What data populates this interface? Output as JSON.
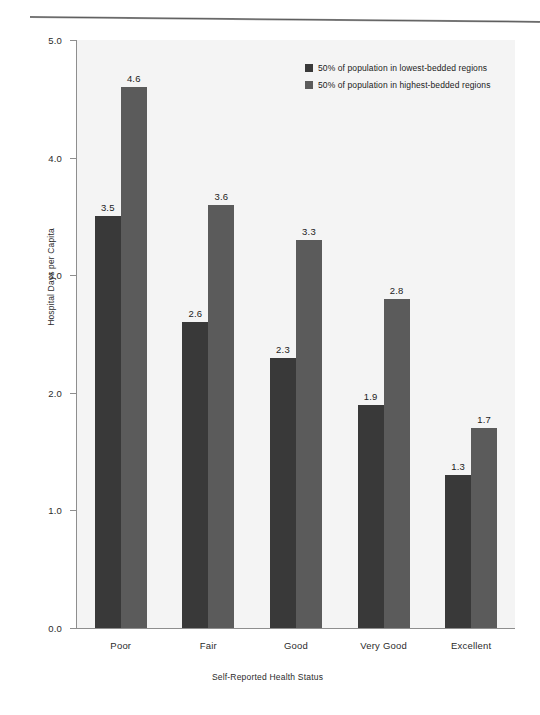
{
  "figure": {
    "top_rule": "horizontal-rule"
  },
  "chart_data": {
    "type": "bar",
    "title": "",
    "xlabel": "Self-Reported Health Status",
    "ylabel": "Hospital Days per Capita",
    "categories": [
      "Poor",
      "Fair",
      "Good",
      "Very Good",
      "Excellent"
    ],
    "series": [
      {
        "name": "50% of population in lowest-bedded regions",
        "color": "#393939",
        "values": [
          3.5,
          2.6,
          2.3,
          1.9,
          1.3
        ]
      },
      {
        "name": "50% of population in highest-bedded regions",
        "color": "#5b5b5b",
        "values": [
          4.6,
          3.6,
          3.3,
          2.8,
          1.7
        ]
      }
    ],
    "ylim": [
      0.0,
      5.0
    ],
    "ytick_labels": [
      "0.0",
      "1.0",
      "2.0",
      "3.0",
      "4.0",
      "5.0"
    ],
    "ytick_values": [
      0.0,
      1.0,
      2.0,
      3.0,
      4.0,
      5.0
    ],
    "grid": false,
    "legend_position": "top-right",
    "value_labels_shown": true,
    "value_labels": {
      "Poor": [
        "3.5",
        "4.6"
      ],
      "Fair": [
        "2.6",
        "3.6"
      ],
      "Good": [
        "2.3",
        "3.3"
      ],
      "Very Good": [
        "1.9",
        "2.8"
      ],
      "Excellent": [
        "1.3",
        "1.7"
      ]
    }
  },
  "legend": {
    "items": [
      {
        "label": "50% of population in lowest-bedded regions",
        "color": "#393939"
      },
      {
        "label": "50% of population in highest-bedded regions",
        "color": "#5b5b5b"
      }
    ]
  },
  "colors": {
    "plot_background": "#f4f4f4",
    "axis": "#8e8e8e",
    "series_low": "#393939",
    "series_high": "#5b5b5b",
    "text": "#1b1b1b"
  }
}
